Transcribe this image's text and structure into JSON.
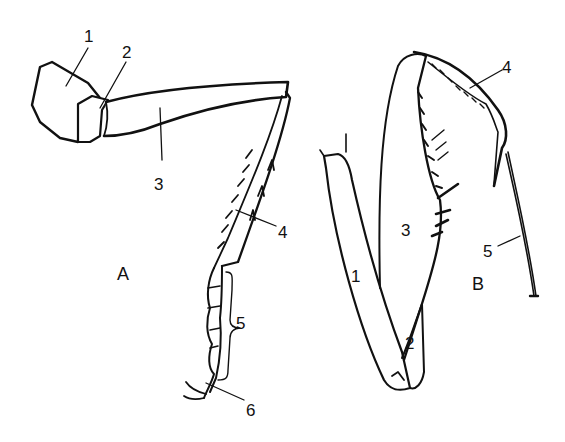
{
  "diagram": {
    "panels": [
      {
        "id": "A",
        "label": "A",
        "type": "walking leg",
        "parts": [
          {
            "num": "1",
            "name": "coxa"
          },
          {
            "num": "2",
            "name": "trochanter"
          },
          {
            "num": "3",
            "name": "femur"
          },
          {
            "num": "4",
            "name": "tibia"
          },
          {
            "num": "5",
            "name": "tarsus"
          },
          {
            "num": "6",
            "name": "claw"
          }
        ]
      },
      {
        "id": "B",
        "label": "B",
        "type": "raptorial leg",
        "parts": [
          {
            "num": "1",
            "name": "coxa"
          },
          {
            "num": "2",
            "name": "trochanter"
          },
          {
            "num": "3",
            "name": "femur"
          },
          {
            "num": "4",
            "name": "tibia"
          },
          {
            "num": "5",
            "name": "tarsus"
          }
        ]
      }
    ],
    "colors": {
      "line": "#111111",
      "background": "#ffffff"
    }
  }
}
